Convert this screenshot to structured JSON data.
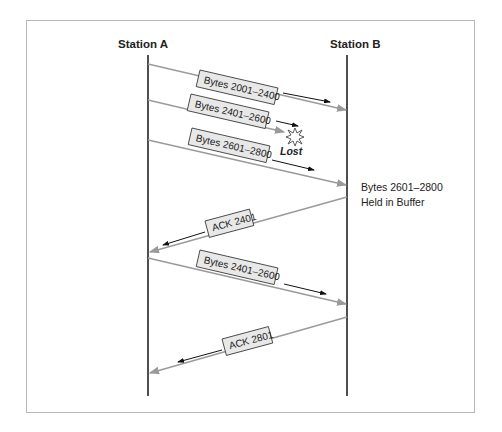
{
  "stations": {
    "a": "Station A",
    "b": "Station B"
  },
  "messages": [
    {
      "label": "Bytes 2001–2400",
      "direction": "A-to-B"
    },
    {
      "label": "Bytes 2401–2600",
      "direction": "A-to-B",
      "status": "Lost"
    },
    {
      "label": "Bytes 2601–2800",
      "direction": "A-to-B"
    },
    {
      "label": "ACK 2401",
      "direction": "B-to-A"
    },
    {
      "label": "Bytes 2401–2600",
      "direction": "A-to-B"
    },
    {
      "label": "ACK 2801",
      "direction": "B-to-A"
    }
  ],
  "lost_label": "Lost",
  "buffer_note": {
    "line1": "Bytes 2601–2800",
    "line2": "Held in Buffer"
  },
  "colors": {
    "line": "#9a9a9a",
    "lifeline": "#222222",
    "label_box": "#e8e8e8"
  }
}
